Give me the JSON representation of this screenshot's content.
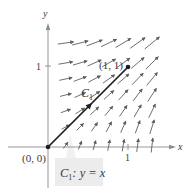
{
  "figure": {
    "axes": {
      "x_label": "x",
      "y_label": "y",
      "x_tick_label": "1",
      "y_tick_label": "1"
    },
    "points": {
      "origin_label": "(0, 0)",
      "end_label": "(1, 1)"
    },
    "curve": {
      "name": "C",
      "subscript": "1",
      "callout_prefix": "C",
      "callout_subscript": "1",
      "callout_equation": ": y = x"
    },
    "colors": {
      "axis": "#8a8a8a",
      "curve": "#1e1e1e",
      "arrow": "#6a6a6a",
      "callout_bg": "#ececec"
    }
  },
  "chart_data": {
    "type": "vector_field",
    "title": "",
    "xlabel": "x",
    "ylabel": "y",
    "x_ticks": [
      1
    ],
    "y_ticks": [
      1
    ],
    "xlim": [
      -0.55,
      1.6
    ],
    "ylim": [
      -0.55,
      1.8
    ],
    "grid": false,
    "curve": {
      "label": "C1: y = x",
      "from": [
        0,
        0
      ],
      "to": [
        1,
        1
      ],
      "direction": "from (0,0) to (1,1)"
    },
    "annotations": [
      "(0, 0)",
      "(1, 1)",
      "C1",
      "C1: y = x"
    ],
    "field_grid": {
      "x": [
        0.22,
        0.4,
        0.58,
        0.76,
        0.94,
        1.12,
        1.3
      ],
      "y": [
        0.02,
        0.25,
        0.45,
        0.65,
        0.85,
        1.05,
        1.3
      ]
    }
  }
}
